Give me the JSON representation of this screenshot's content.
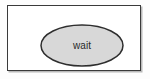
{
  "diagram": {
    "title": "wait",
    "background_color": "#fdfdfd",
    "frame": {
      "name": "diagram-frame",
      "border_color": "#3a3a3a",
      "fill_color": "#ffffff",
      "shadow_color": "#b9b9b9"
    },
    "nodes": [
      {
        "id": "wait",
        "shape": "ellipse",
        "label": "wait",
        "fill_color": "#d8d8d8",
        "stroke_color": "#2e2e2e",
        "text_color": "#2a2a2a"
      }
    ]
  }
}
